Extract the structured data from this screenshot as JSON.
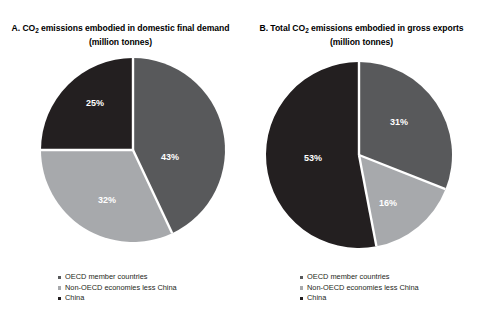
{
  "colors": {
    "oecd": "#58595b",
    "non_oecd": "#a7a9ac",
    "china": "#231f20",
    "separator": "#ffffff",
    "background": "#ffffff",
    "text": "#231f20",
    "label_text": "#ffffff"
  },
  "panels": [
    {
      "title_prefix": "A. CO",
      "title_sub": "2",
      "title_rest": " emissions embodied in domestic final demand",
      "title_line2": "(million tonnes)",
      "labels": {
        "oecd": "43%",
        "non_oecd": "32%",
        "china": "25%"
      },
      "legend": [
        "OECD member countries",
        "Non-OECD economies less China",
        "China"
      ]
    },
    {
      "title_prefix": "B. Total CO",
      "title_sub": "2",
      "title_rest": " emissions embodied in gross exports",
      "title_line2": "(million tonnes)",
      "labels": {
        "oecd": "31%",
        "non_oecd": "16%",
        "china": "53%"
      },
      "legend": [
        "OECD member countries",
        "Non-OECD economies less China",
        "China"
      ]
    }
  ],
  "chart_data": [
    {
      "type": "pie",
      "title": "A. CO2 emissions embodied in domestic final demand (million tonnes)",
      "categories": [
        "OECD member countries",
        "Non-OECD economies less China",
        "China"
      ],
      "values": [
        43,
        32,
        25
      ],
      "value_labels": [
        "43%",
        "32%",
        "25%"
      ],
      "colors": [
        "#58595b",
        "#a7a9ac",
        "#231f20"
      ],
      "start_angle_deg": 0,
      "direction": "clockwise",
      "legend_position": "bottom-left",
      "grid": false
    },
    {
      "type": "pie",
      "title": "B. Total CO2 emissions embodied in gross exports (million tonnes)",
      "categories": [
        "OECD member countries",
        "Non-OECD economies less China",
        "China"
      ],
      "values": [
        31,
        16,
        53
      ],
      "value_labels": [
        "31%",
        "16%",
        "53%"
      ],
      "colors": [
        "#58595b",
        "#a7a9ac",
        "#231f20"
      ],
      "start_angle_deg": 0,
      "direction": "clockwise",
      "legend_position": "bottom-left",
      "grid": false
    }
  ]
}
